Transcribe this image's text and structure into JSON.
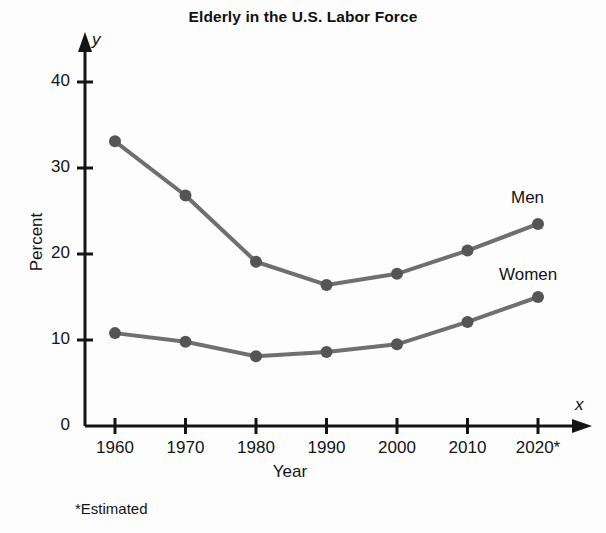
{
  "chart_data": {
    "type": "line",
    "title": "Elderly in the U.S. Labor Force",
    "xlabel": "Year",
    "ylabel": "Percent",
    "x_axis_variable": "x",
    "y_axis_variable": "y",
    "categories": [
      "1960",
      "1970",
      "1980",
      "1990",
      "2000",
      "2010",
      "2020*"
    ],
    "x_values": [
      1960,
      1970,
      1980,
      1990,
      2000,
      2010,
      2020
    ],
    "y_ticks": [
      "0",
      "10",
      "20",
      "30",
      "40"
    ],
    "y_tick_values": [
      0,
      10,
      20,
      30,
      40
    ],
    "ylim": [
      0,
      44
    ],
    "grid": false,
    "legend_position": "inline-right",
    "series": [
      {
        "name": "Men",
        "values": [
          33.1,
          26.8,
          19.1,
          16.4,
          17.7,
          20.4,
          23.5
        ],
        "color": "#6f6f6f",
        "marker_color": "#555555"
      },
      {
        "name": "Women",
        "values": [
          10.8,
          9.8,
          8.1,
          8.6,
          9.5,
          12.1,
          15.0
        ],
        "color": "#6f6f6f",
        "marker_color": "#555555"
      }
    ],
    "footnote": "*Estimated",
    "axis_color": "#141414"
  }
}
